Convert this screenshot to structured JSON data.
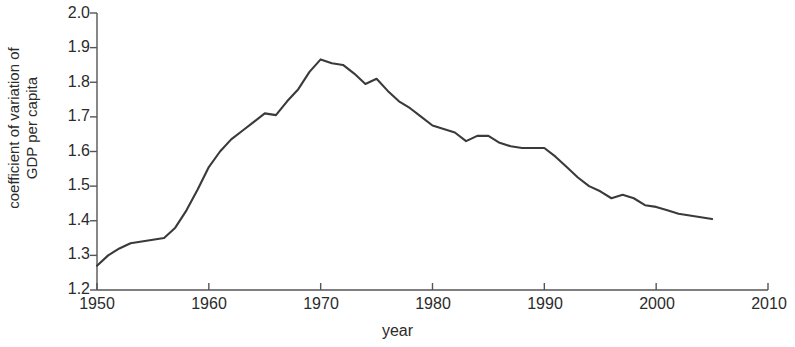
{
  "chart_data": {
    "type": "line",
    "title": "",
    "xlabel": "year",
    "ylabel": "coefficient of variation of GDP per capita",
    "ylabel_line1": "coefficient of variation of",
    "ylabel_line2": "GDP per capita",
    "xlim": [
      1950,
      2010
    ],
    "ylim": [
      1.2,
      2.0
    ],
    "xticks": [
      1950,
      1960,
      1970,
      1980,
      1990,
      2000,
      2010
    ],
    "yticks": [
      1.2,
      1.3,
      1.4,
      1.5,
      1.6,
      1.7,
      1.8,
      1.9,
      2.0
    ],
    "ytick_labels": [
      "1.2",
      "1.3",
      "1.4",
      "1.5",
      "1.6",
      "1.7",
      "1.8",
      "1.9",
      "2.0"
    ],
    "xtick_labels": [
      "1950",
      "1960",
      "1970",
      "1980",
      "1990",
      "2000",
      "2010"
    ],
    "grid": false,
    "legend": false,
    "line_color": "#3a3a3a",
    "axis_color": "#555555",
    "background": "#ffffff",
    "series": [
      {
        "name": "coefficient of variation of GDP per capita",
        "x": [
          1950,
          1951,
          1952,
          1953,
          1954,
          1955,
          1956,
          1957,
          1958,
          1959,
          1960,
          1961,
          1962,
          1963,
          1964,
          1965,
          1966,
          1967,
          1968,
          1969,
          1970,
          1971,
          1972,
          1973,
          1974,
          1975,
          1976,
          1977,
          1978,
          1979,
          1980,
          1981,
          1982,
          1983,
          1984,
          1985,
          1986,
          1987,
          1988,
          1989,
          1990,
          1991,
          1992,
          1993,
          1994,
          1995,
          1996,
          1997,
          1998,
          1999,
          2000,
          2001,
          2002,
          2003,
          2004,
          2005
        ],
        "values": [
          1.27,
          1.3,
          1.32,
          1.335,
          1.34,
          1.345,
          1.35,
          1.38,
          1.43,
          1.49,
          1.555,
          1.6,
          1.635,
          1.66,
          1.685,
          1.71,
          1.705,
          1.745,
          1.78,
          1.83,
          1.866,
          1.855,
          1.85,
          1.825,
          1.795,
          1.81,
          1.775,
          1.745,
          1.725,
          1.7,
          1.675,
          1.665,
          1.655,
          1.63,
          1.645,
          1.645,
          1.625,
          1.615,
          1.61,
          1.61,
          1.61,
          1.585,
          1.555,
          1.525,
          1.5,
          1.485,
          1.465,
          1.475,
          1.465,
          1.445,
          1.44,
          1.43,
          1.42,
          1.415,
          1.41,
          1.405
        ]
      }
    ]
  },
  "axes": {
    "plot_left_px": 97,
    "plot_right_px": 768,
    "plot_top_px": 13,
    "plot_bottom_px": 290
  }
}
